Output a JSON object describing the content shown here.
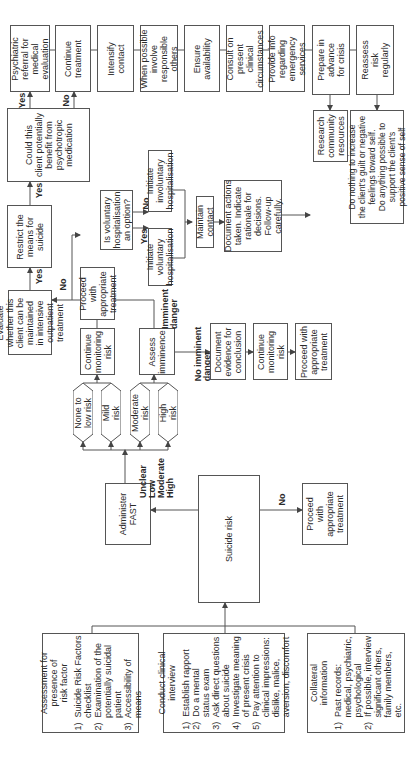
{
  "diagram": {
    "type": "flowchart",
    "orientation": "rotated 90 degrees counter-clockwise",
    "assessment_inputs": [
      {
        "id": "risk_factor",
        "title": "Assessment for\npresence of\nrisk factor",
        "items": "1)  Suicide Risk Factors\n     checklist\n2)  Examination of the\n     potentially suicidal\n     patient\n3)  Accessibility of\n     means"
      },
      {
        "id": "clinical_interview",
        "title": "Conduct clinical\ninterview",
        "items": "1)  Establish rapport\n2)  Do a mental\n     status exam\n3)  Ask direct questions\n     about suicide\n4)  Investigate meaning\n     of present crisis\n5)  Pay attention to\n     clinical impressions:\n     dislike, malice,\n     aversion, discomfort"
      },
      {
        "id": "collateral",
        "title": "Collateral\ninformation",
        "items": "1)  Past records:\n     medical, psychiatric,\n     psychological\n2)  If possible, interview\n     significant others,\n     family members,\n     etc."
      }
    ],
    "nodes": {
      "suicide_risk": "Suicide risk",
      "administer_fast": "Administer\nFAST",
      "proceed_no_risk": "Proceed\nwith\nappropriate\ntreatment",
      "none_low": "None to\nlow risk",
      "mild": "Mild\nrisk",
      "moderate": "Moderate\nrisk",
      "high": "High\nrisk",
      "continue_monitoring_1": "Continue\nmonitoring\nrisk",
      "proceed_1": "Proceed\nwith\nappropriate\ntreatment",
      "assess_imminence": "Assess\nimminence",
      "document_evidence": "Document\nevidence for\nconclusion",
      "continue_monitoring_2": "Continue\nmonitoring\nrisk",
      "proceed_2": "Proceed with\nappropriate\ntreatment",
      "evaluate_outpatient": "Evaluate\nwhether this\nclient can be\nmaintained\nin intensive\noutpatient\ntreatment",
      "restrict_means": "Restrict the\nmeans for\nsuicide",
      "voluntary_option": "Is voluntary\nhospitalisation\nan option?",
      "initiate_voluntary": "Initiate\nvoluntary\nhospitalisation",
      "initiate_involuntary": "Initiate\ninvoluntary\nhospitalisation",
      "maintain_contact": "Maintain\ncontact",
      "document_actions": "Document actions\ntaken. Indicate\nrationale for\ndecisions.\nFollow-up\ncarefully.",
      "psychotropic": "Could this\nclient potentially\nbenefit from\npsychotropic\nmedication",
      "psychiatric_referral": "Psychiatric\nreferral for\nmedical\nevaluation",
      "continue_treatment": "Continue\ntreatment",
      "intensify_contact": "Intensify\ncontact",
      "involve_others": "When possible\ninvolve\nresponsible\nothers",
      "ensure_availability": "Ensure\navailability",
      "consult": "Consult on\npresent\nclinical\ncircumstances",
      "provide_info": "Provide info\nregarding\nemergency\nservices",
      "prepare_crisis": "Prepare in\nadvance\nfor crisis",
      "reassess": "Reassess\nrisk\nregularly",
      "research_resources": "Research\ncommunity\nresources",
      "do_nothing": "Do nothing to increase\nthe client's guilt or negative\nfeelings toward self.\nDo anything possible to\nsupport the client's\npositive sense of self"
    },
    "edge_labels": {
      "risk_levels": "Unclear\nLow\nModerate\nHigh",
      "no_risk": "No",
      "imminent": "Imminent\ndanger",
      "no_imminent": "No imminent\ndanger",
      "yes_evaluate": "Yes",
      "no_evaluate": "No",
      "yes_restrict": "Yes",
      "yes_voluntary": "Yes",
      "no_voluntary": "No",
      "yes_psychotropic": "Yes",
      "no_psychotropic": "No"
    }
  }
}
